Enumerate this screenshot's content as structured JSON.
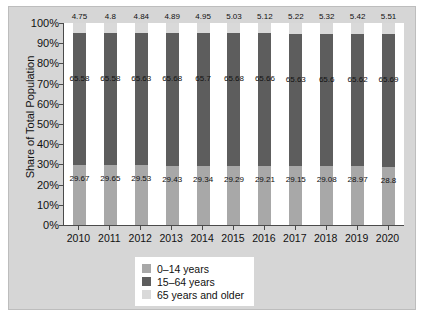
{
  "chart_data": {
    "type": "bar",
    "subtype": "stacked-100-percent",
    "title": "",
    "xlabel": "",
    "ylabel": "Share of Total Population",
    "ylim": [
      0,
      100
    ],
    "grid": false,
    "legend_position": "bottom-center",
    "categories": [
      "2010",
      "2011",
      "2012",
      "2013",
      "2014",
      "2015",
      "2016",
      "2017",
      "2018",
      "2019",
      "2020"
    ],
    "y_ticks": [
      "0%",
      "10%",
      "20%",
      "30%",
      "40%",
      "50%",
      "60%",
      "70%",
      "80%",
      "90%",
      "100%"
    ],
    "y_tick_values": [
      0,
      10,
      20,
      30,
      40,
      50,
      60,
      70,
      80,
      90,
      100
    ],
    "series": [
      {
        "name": "0–14 years",
        "color": "#a8a8a8",
        "values": [
          29.67,
          29.65,
          29.53,
          29.43,
          29.34,
          29.29,
          29.21,
          29.15,
          29.08,
          28.97,
          28.8
        ],
        "labels": [
          "29.67",
          "29.65",
          "29.53",
          "29.43",
          "29.34",
          "29.29",
          "29.21",
          "29.15",
          "29.08",
          "28.97",
          "28.8"
        ]
      },
      {
        "name": "15–64 years",
        "color": "#5d5d5d",
        "values": [
          65.58,
          65.58,
          65.63,
          65.68,
          65.7,
          65.68,
          65.66,
          65.63,
          65.6,
          65.62,
          65.69
        ],
        "labels": [
          "65.58",
          "65.58",
          "65.63",
          "65.68",
          "65.7",
          "65.68",
          "65.66",
          "65.63",
          "65.6",
          "65.62",
          "65.69"
        ]
      },
      {
        "name": "65 years and older",
        "color": "#d9d9d9",
        "values": [
          4.75,
          4.8,
          4.84,
          4.89,
          4.95,
          5.03,
          5.12,
          5.22,
          5.32,
          5.42,
          5.51
        ],
        "labels": [
          "4.75",
          "4.8",
          "4.84",
          "4.89",
          "4.95",
          "5.03",
          "5.12",
          "5.22",
          "5.32",
          "5.42",
          "5.51"
        ]
      }
    ]
  },
  "legend": {
    "items": [
      {
        "label": "0–14 years",
        "color": "#a8a8a8"
      },
      {
        "label": "15–64 years",
        "color": "#5d5d5d"
      },
      {
        "label": "65 years and older",
        "color": "#d9d9d9"
      }
    ]
  },
  "colors": {
    "outer_background": "#d6d6d6",
    "plot_background": "#ffffff",
    "axis": "#4a4a4a",
    "text": "#111111",
    "young": "#a8a8a8",
    "adult": "#5d5d5d",
    "older": "#d9d9d9"
  }
}
